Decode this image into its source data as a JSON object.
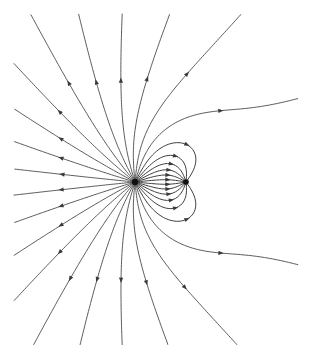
{
  "figure": {
    "type": "field-line-diagram",
    "width": 312,
    "height": 359,
    "background_color": "#ffffff",
    "line_color": "#4a4a4a",
    "arrow_color": "#3a3a3a",
    "charge_color": "#111111",
    "line_width": 0.9
  },
  "chart_data": {
    "type": "scatter",
    "xlabel": "",
    "ylabel": "",
    "grid": false,
    "legend": "none",
    "xlim": [
      0,
      312
    ],
    "ylim": [
      0,
      359
    ],
    "charges": [
      {
        "name": "source-charge",
        "sign": "positive",
        "x": 135,
        "y": 182,
        "radius": 3.2,
        "relative_magnitude": 3,
        "label": ""
      },
      {
        "name": "sink-charge",
        "sign": "negative",
        "x": 186,
        "y": 182,
        "radius": 2.8,
        "relative_magnitude": 1,
        "label": ""
      }
    ],
    "loop_count": 12,
    "radial_line_count": 32,
    "arrow_direction": "outward-from-positive-charge"
  },
  "elements": {
    "canvas_name": "field-line-canvas",
    "positive_charge_name": "positive-charge-dot",
    "negative_charge_name": "negative-charge-dot",
    "radial_group_name": "radial-field-lines",
    "loop_group_name": "dipole-loop-lines",
    "arrow_group_name": "field-direction-arrows"
  }
}
